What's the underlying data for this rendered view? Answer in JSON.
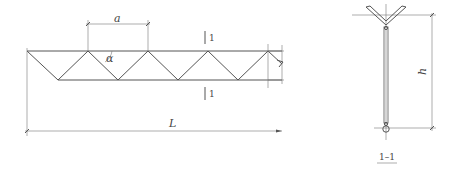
{
  "diagram": {
    "elevation": {
      "labels": {
        "spacing": "a",
        "angle": "α",
        "length": "L",
        "section_mark_top": "1",
        "section_mark_bottom": "1"
      },
      "top_nodes_x": [
        27,
        88,
        148,
        208,
        268
      ],
      "bottom_nodes_x": [
        58,
        118,
        178,
        238
      ]
    },
    "section": {
      "title": "1–1",
      "height_label": "h"
    },
    "colors": {
      "line": "#555555",
      "text": "#444444",
      "background": "#ffffff"
    }
  }
}
